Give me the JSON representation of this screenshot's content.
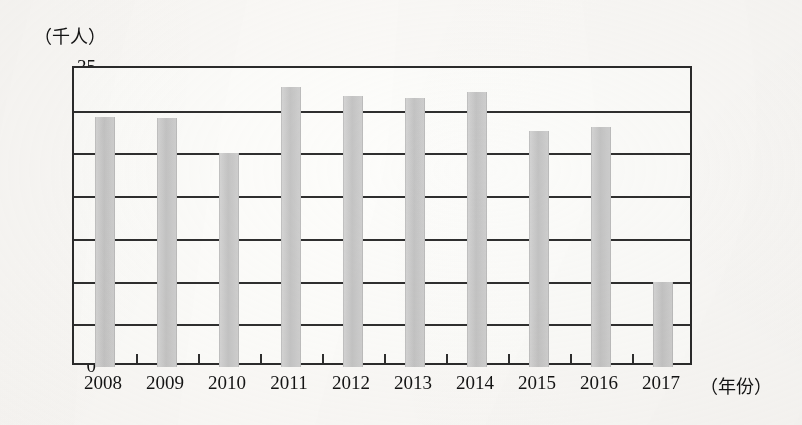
{
  "chart_data": {
    "type": "bar",
    "title": "",
    "subtitle": "",
    "xlabel": "（年份）",
    "ylabel": "（千人）",
    "categories": [
      "2008",
      "2009",
      "2010",
      "2011",
      "2012",
      "2013",
      "2014",
      "2015",
      "2016",
      "2017"
    ],
    "values": [
      29.3,
      29.1,
      25.0,
      32.8,
      31.7,
      31.5,
      32.2,
      27.6,
      28.1,
      10.0
    ],
    "ylim": [
      0,
      35
    ],
    "ytick_labels": [
      "0",
      "5",
      "10",
      "15",
      "20",
      "25",
      "30",
      "35"
    ],
    "ytick_values": [
      0,
      5,
      10,
      15,
      20,
      25,
      30,
      35
    ],
    "grid": true,
    "grid_axis": "y",
    "legend": false,
    "legend_position": "none",
    "bar_color": "#c9c9c9",
    "axis_color": "#2b2b2b",
    "background_color": "#fbfaf8"
  },
  "axes": {
    "y_unit_caption": "（千人）",
    "x_unit_caption": "（年份）"
  }
}
